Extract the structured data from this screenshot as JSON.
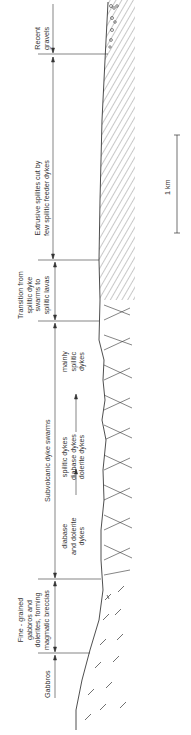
{
  "diagram": {
    "orientation": "rotated -90deg (profile reads bottom-to-top)",
    "zones": [
      {
        "id": "recent-gravels",
        "lines": [
          "Recent",
          "gravels"
        ],
        "y_top": 2,
        "y_bottom": 53
      },
      {
        "id": "extrusive-spilites",
        "lines": [
          "Extrusive spilites cut by",
          "few spilitic feeder dykes"
        ],
        "y_top": 57,
        "y_bottom": 259
      },
      {
        "id": "transition",
        "lines": [
          "Transition from",
          "spilitic dyke",
          "swarms to",
          "spilitic lavas"
        ],
        "y_top": 262,
        "y_bottom": 320
      },
      {
        "id": "subvolcanic-dyke-swarms",
        "lines": [
          "Subvolcanic dyke swarms"
        ],
        "y_top": 323,
        "y_bottom": 578
      }
    ],
    "subvolcanic_subzones": {
      "mainly_spilitic": [
        "mainly",
        "spilitic",
        "dykes"
      ],
      "middle": [
        "spilitic dykes",
        "diabase dykes",
        "dolerite dykes"
      ],
      "diabase_dolerite": [
        "diabase",
        "and dolerite",
        "dykes"
      ]
    },
    "lower_zones": [
      {
        "id": "fine-grained-gabbros",
        "lines": [
          "Fine - grained",
          "gabbros and",
          "dolerites, forming",
          "magmatic breccias"
        ],
        "y_top": 581,
        "y_bottom": 652
      },
      {
        "id": "gabbros",
        "lines": [
          "Gabbros"
        ],
        "y_top": 655,
        "y_bottom": 700
      }
    ],
    "scale_bar": {
      "label": "1 km",
      "y_top": 135,
      "y_bottom": 233
    }
  }
}
